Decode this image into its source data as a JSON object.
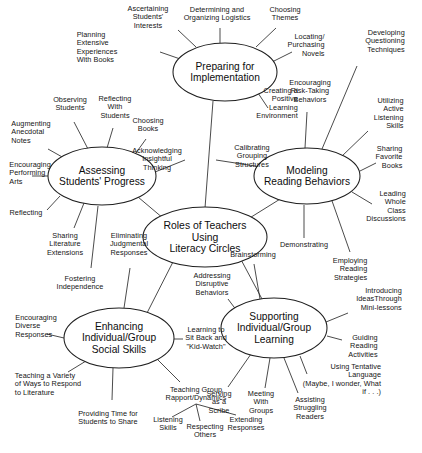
{
  "diagram": {
    "type": "mind-map",
    "title": "Roles of Teachers Using Literacy Circles",
    "center": {
      "id": "center",
      "label": "Roles of Teachers\nUsing\nLiteracy Circles",
      "cx": 205,
      "cy": 237,
      "rx": 62,
      "ry": 30
    },
    "nodes": [
      {
        "id": "preparing",
        "label": "Preparing for\nImplementation",
        "cx": 225,
        "cy": 72,
        "rx": 52,
        "ry": 29,
        "branches": [
          {
            "label": "Planning\nExtensive\nExperiences\nWith Books",
            "x": 97,
            "y": 48,
            "align": "right",
            "ex": 186,
            "ey": 61
          },
          {
            "label": "Ascertaining\nStudents'\nInterests",
            "x": 148,
            "y": 18,
            "align": "center",
            "ex": 196,
            "ey": 47
          },
          {
            "label": "Determining and\nOrganizing Logistics",
            "x": 217,
            "y": 14,
            "align": "center",
            "ex": 220,
            "ey": 43
          },
          {
            "label": "Choosing\nThemes",
            "x": 285,
            "y": 14,
            "align": "center",
            "ex": 256,
            "ey": 47
          },
          {
            "label": "Locating/\nPurchasing\nNovels",
            "x": 306,
            "y": 46,
            "align": "left",
            "ex": 268,
            "ey": 64
          },
          {
            "label": "Creating a\nPositive\nLearning\nEnvironment",
            "x": 277,
            "y": 104,
            "align": "left",
            "ex": 258,
            "ey": 93
          }
        ]
      },
      {
        "id": "modeling",
        "label": "Modeling\nReading Behaviors",
        "cx": 307,
        "cy": 176,
        "rx": 53,
        "ry": 28,
        "branches": [
          {
            "label": "Developing\nQuestioning\nTechniques",
            "x": 385,
            "y": 42,
            "align": "left",
            "ex": 322,
            "ey": 149
          },
          {
            "label": "Encouraging\nRisk-Taking\nBehaviors",
            "x": 310,
            "y": 92,
            "align": "center",
            "ex": 305,
            "ey": 148
          },
          {
            "label": "Utilizing Active\nListening Skills",
            "x": 385,
            "y": 114,
            "align": "left",
            "ex": 341,
            "ey": 157
          },
          {
            "label": "Sharing\nFavorite\nBooks",
            "x": 389,
            "y": 158,
            "align": "left",
            "ex": 358,
            "ey": 172
          },
          {
            "label": "Leading\nWhole Class\nDiscussions",
            "x": 386,
            "y": 207,
            "align": "left",
            "ex": 350,
            "ey": 194
          },
          {
            "label": "Demonstrating",
            "x": 304,
            "y": 245,
            "align": "center",
            "ex": 304,
            "ey": 205
          },
          {
            "label": "Employing\nReading\nStrategies",
            "x": 350,
            "y": 270,
            "align": "left",
            "ex": 330,
            "ey": 199
          }
        ]
      },
      {
        "id": "assessing",
        "label": "Assessing\nStudents' Progress",
        "cx": 102,
        "cy": 176,
        "rx": 54,
        "ry": 29,
        "branches": [
          {
            "label": "Observing\nStudents",
            "x": 70,
            "y": 104,
            "align": "center",
            "ex": 88,
            "ey": 149
          },
          {
            "label": "Reflecting\nWith\nStudents",
            "x": 115,
            "y": 108,
            "align": "center",
            "ex": 107,
            "ey": 148
          },
          {
            "label": "Augmenting\nAnecdotal\nNotes",
            "x": 31,
            "y": 133,
            "align": "right",
            "ex": 64,
            "ey": 158
          },
          {
            "label": "Encouraging\nPerforming\nArts",
            "x": 30,
            "y": 174,
            "align": "right",
            "ex": 48,
            "ey": 176
          },
          {
            "label": "Reflecting",
            "x": 26,
            "y": 213,
            "align": "right",
            "ex": 60,
            "ey": 196
          },
          {
            "label": "Sharing\nLiterature\nExtensions",
            "x": 65,
            "y": 245,
            "align": "center",
            "ex": 85,
            "ey": 203
          },
          {
            "label": "Fostering\nIndependence",
            "x": 80,
            "y": 283,
            "align": "center",
            "ex": 95,
            "ey": 206
          },
          {
            "label": "Choosing\nBooks",
            "x": 148,
            "y": 125,
            "align": "center",
            "ex": 133,
            "ey": 157
          }
        ]
      },
      {
        "id": "enhancing",
        "label": "Enhancing\nIndividual/Group\nSocial Skills",
        "cx": 119,
        "cy": 338,
        "rx": 55,
        "ry": 30,
        "branches": [
          {
            "label": "Eliminating\nJudgmental\nResponses",
            "x": 129,
            "y": 245,
            "align": "center",
            "ex": 124,
            "ey": 308
          },
          {
            "label": "Encouraging\nDiverse\nResponses",
            "x": 36,
            "y": 327,
            "align": "right",
            "ex": 64,
            "ey": 338
          },
          {
            "label": "Teaching a Variety\nof Ways to Respond\nto Literature",
            "x": 48,
            "y": 385,
            "align": "right",
            "ex": 85,
            "ey": 362
          },
          {
            "label": "Providing Time for\nStudents to Share",
            "x": 108,
            "y": 418,
            "align": "center",
            "ex": 113,
            "ey": 368
          },
          {
            "label": "Teaching Group\nRapport/Dynamics",
            "x": 196,
            "y": 394,
            "align": "center",
            "ex": 158,
            "ey": 360
          },
          {
            "label": "Learning to\nSit Back and\n\"Kid-Watch\"",
            "x": 206,
            "y": 339,
            "align": "center",
            "ex": 174,
            "ey": 339
          }
        ],
        "subbranches": [
          {
            "parent": "Teaching Group\nRapport/Dynamics",
            "label": "Listening\nSkills",
            "x": 168,
            "y": 424,
            "px": 196,
            "py": 404
          },
          {
            "parent": "Teaching Group\nRapport/Dynamics",
            "label": "Respecting\nOthers",
            "x": 205,
            "y": 431,
            "px": 196,
            "py": 404
          },
          {
            "parent": "Teaching Group\nRapport/Dynamics",
            "label": "Extending\nResponses",
            "x": 246,
            "y": 424,
            "px": 196,
            "py": 404
          }
        ]
      },
      {
        "id": "supporting",
        "label": "Supporting\nIndividual/Group\nLearning",
        "cx": 274,
        "cy": 328,
        "rx": 53,
        "ry": 30,
        "branches": [
          {
            "label": "Brainstorming",
            "x": 253,
            "y": 255,
            "align": "center",
            "ex": 260,
            "ey": 299
          },
          {
            "label": "Addressing\nDisruptive\nBehaviors",
            "x": 212,
            "y": 285,
            "align": "center",
            "ex": 236,
            "ey": 312
          },
          {
            "label": "Introducing\nIdeasThrough\nMini-lessons",
            "x": 379,
            "y": 300,
            "align": "left",
            "ex": 326,
            "ey": 322
          },
          {
            "label": "Guiding\nReading\nActivities",
            "x": 363,
            "y": 347,
            "align": "left",
            "ex": 327,
            "ey": 336
          },
          {
            "label": "Using Tentative Language\n(Maybe, I wonder, What if . . .)",
            "x": 340,
            "y": 380,
            "align": "left",
            "ex": 300,
            "ey": 356
          },
          {
            "label": "Assisting\nStruggling\nReaders",
            "x": 310,
            "y": 409,
            "align": "center",
            "ex": 284,
            "ey": 358
          },
          {
            "label": "Meeting\nWith\nGroups",
            "x": 261,
            "y": 403,
            "align": "center",
            "ex": 270,
            "ey": 358
          },
          {
            "label": "Serving\nas a\nScribe",
            "x": 219,
            "y": 403,
            "align": "center",
            "ex": 250,
            "ey": 354
          }
        ]
      }
    ],
    "connector_labels": [
      {
        "label": "Acknowledging\nInsightful\nThinking",
        "x": 157,
        "y": 160
      },
      {
        "label": "Calibrating\nGrouping\nStructures",
        "x": 252,
        "y": 157
      }
    ]
  }
}
